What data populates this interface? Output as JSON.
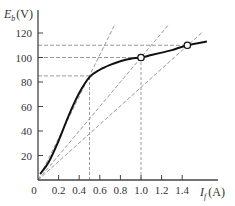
{
  "chart_data": {
    "type": "line",
    "title": "",
    "xlabel": "I_f (A)",
    "ylabel": "E_b (V)",
    "xlabel_main": "I",
    "xlabel_sub": "f",
    "xlabel_unit": "(A)",
    "ylabel_main": "E",
    "ylabel_sub": "b",
    "ylabel_unit": "(V)",
    "xlim": [
      0,
      1.6
    ],
    "ylim": [
      0,
      125
    ],
    "x_ticks": [
      0.2,
      0.4,
      0.6,
      0.8,
      1.0,
      1.2,
      1.4
    ],
    "x_tick_labels": [
      "0",
      "0.2",
      "0.4",
      "0.6",
      "0.8",
      "1.0",
      "1.2",
      "1.4"
    ],
    "y_ticks": [
      20,
      40,
      60,
      80,
      100,
      120
    ],
    "y_tick_labels": [
      "20",
      "40",
      "60",
      "80",
      "100",
      "120"
    ],
    "grid": false,
    "series": [
      {
        "name": "Magnetization curve",
        "style": "solid",
        "color": "#111111",
        "x": [
          0.02,
          0.1,
          0.2,
          0.3,
          0.4,
          0.5,
          0.6,
          0.7,
          0.8,
          0.9,
          1.0,
          1.1,
          1.2,
          1.3,
          1.45,
          1.64
        ],
        "y": [
          5,
          14,
          32,
          53,
          71,
          84,
          90,
          94,
          97,
          99,
          100,
          102,
          104,
          106,
          110,
          113
        ]
      }
    ],
    "resistance_lines": [
      {
        "name": "field-resistance-line-1",
        "through": [
          0.5,
          85
        ],
        "end": [
          0.74,
          126
        ]
      },
      {
        "name": "field-resistance-line-2",
        "through": [
          1.0,
          100
        ],
        "end": [
          1.26,
          126
        ]
      },
      {
        "name": "field-resistance-line-3",
        "through": [
          1.45,
          110
        ],
        "end": [
          1.6,
          121
        ]
      }
    ],
    "reference_lines": {
      "horizontal": [
        {
          "y": 85,
          "x_end": 0.5
        },
        {
          "y": 100,
          "x_end": 1.0
        },
        {
          "y": 110,
          "x_end": 1.45
        }
      ],
      "vertical": [
        {
          "x": 0.5,
          "y_end": 85
        },
        {
          "x": 1.0,
          "y_end": 100
        }
      ]
    },
    "marked_points": [
      {
        "x": 1.0,
        "y": 100
      },
      {
        "x": 1.45,
        "y": 110
      }
    ],
    "dashed_color": "#9a9a9a"
  },
  "layout": {
    "origin_px": [
      38,
      180
    ],
    "px_per_x": 103,
    "px_per_y": 1.225
  }
}
